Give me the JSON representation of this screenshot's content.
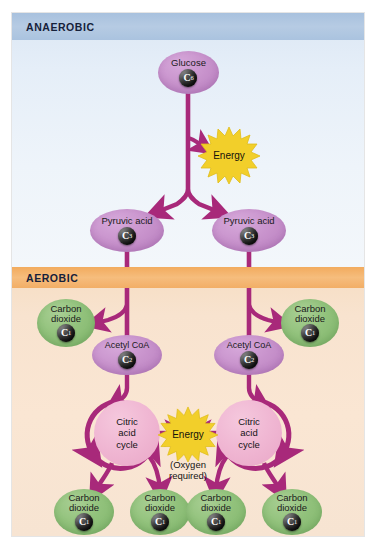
{
  "figure": {
    "colors": {
      "anaerobic_band": "#a8c1de",
      "anaerobic_bg": "#e5eef8",
      "aerobic_band": "#f2ab5e",
      "aerobic_bg": "#f8e3cf",
      "arrow": "#a8297a",
      "molecule_purple": "#c994cd",
      "molecule_green": "#92c27c",
      "cycle_pink": "#f0b7d3",
      "energy_yellow": "#f5d52e",
      "carbon_sphere": "#1a1a1a"
    }
  },
  "bands": {
    "anaerobic": "ANAEROBIC",
    "aerobic": "AEROBIC"
  },
  "nodes": {
    "glucose": {
      "label": "Glucose",
      "carbon": "C",
      "carbon_count": "6"
    },
    "pyruvic_left": {
      "label": "Pyruvic acid",
      "carbon": "C",
      "carbon_count": "3"
    },
    "pyruvic_right": {
      "label": "Pyruvic acid",
      "carbon": "C",
      "carbon_count": "3"
    },
    "acetyl_left": {
      "label": "Acetyl CoA",
      "carbon": "C",
      "carbon_count": "2"
    },
    "acetyl_right": {
      "label": "Acetyl CoA",
      "carbon": "C",
      "carbon_count": "2"
    },
    "co2_mid_left": {
      "label": "Carbon\ndioxide",
      "carbon": "C",
      "carbon_count": "1"
    },
    "co2_mid_right": {
      "label": "Carbon\ndioxide",
      "carbon": "C",
      "carbon_count": "1"
    },
    "co2_bottom_1": {
      "label": "Carbon\ndioxide",
      "carbon": "C",
      "carbon_count": "1"
    },
    "co2_bottom_2": {
      "label": "Carbon\ndioxide",
      "carbon": "C",
      "carbon_count": "1"
    },
    "co2_bottom_3": {
      "label": "Carbon\ndioxide",
      "carbon": "C",
      "carbon_count": "1"
    },
    "co2_bottom_4": {
      "label": "Carbon\ndioxide",
      "carbon": "C",
      "carbon_count": "1"
    }
  },
  "cycles": {
    "left": "Citric\nacid\ncycle",
    "right": "Citric\nacid\ncycle"
  },
  "energy": {
    "glycolysis_label": "Energy",
    "krebs_label": "Energy",
    "oxygen_note": "(Oxygen\nrequired)"
  }
}
